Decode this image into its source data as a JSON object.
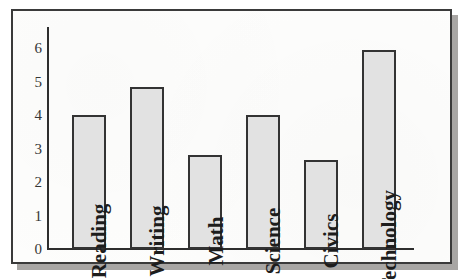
{
  "chart_data": {
    "type": "bar",
    "title": "",
    "subtitle": "",
    "xlabel": "",
    "ylabel": "",
    "categories": [
      "Reading",
      "Writing",
      "Math",
      "Science",
      "Civics",
      "Technology"
    ],
    "values": [
      4.0,
      4.85,
      2.8,
      4.0,
      2.65,
      5.95
    ],
    "ylim": [
      0,
      6
    ],
    "y_ticks": [
      "0",
      "1",
      "2",
      "3",
      "4",
      "5",
      "6"
    ],
    "grid": false,
    "legend": false,
    "legend_position": "none",
    "label_orientation": "vertical",
    "bar_fill_color": "#e2e2e2",
    "bar_border_color": "#333333",
    "axis_color": "#2e2e2e",
    "background_color": "#fdfdfc",
    "frame_border_color": "#3a3a3a",
    "shadow_color": "#a8a6a4"
  }
}
